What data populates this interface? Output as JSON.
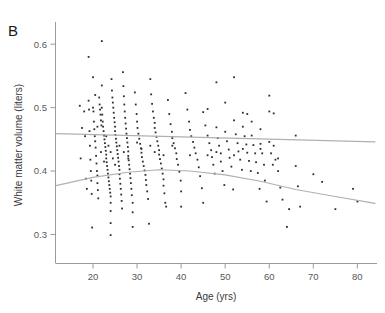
{
  "figure": {
    "panel_label": "B",
    "background_color": "#ffffff"
  },
  "axes": {
    "x_title": "Age (yrs)",
    "y_title": "White matter volume (liters)",
    "x_ticks": [
      "20",
      "30",
      "40",
      "50",
      "60",
      "70",
      "80"
    ],
    "y_ticks": [
      "0.3",
      "0.4",
      "0.5",
      "0.6"
    ]
  },
  "chart_data": {
    "type": "scatter",
    "title": "",
    "panel": "B",
    "xlabel": "Age (yrs)",
    "ylabel": "White matter volume (liters)",
    "xlim": [
      11.5,
      84.0
    ],
    "ylim": [
      0.255,
      0.635
    ],
    "xticks": [
      20,
      30,
      40,
      50,
      60,
      70,
      80
    ],
    "yticks": [
      0.3,
      0.4,
      0.5,
      0.6
    ],
    "grid": false,
    "legend": "none",
    "point_color": "#2e2e32",
    "trend_color": "#b0b0b2",
    "series": [
      {
        "name": "White matter volume",
        "marker": "square",
        "points": [
          [
            17.0,
            0.503
          ],
          [
            17.2,
            0.42
          ],
          [
            17.5,
            0.468
          ],
          [
            18.0,
            0.494
          ],
          [
            18.2,
            0.455
          ],
          [
            18.4,
            0.388
          ],
          [
            18.6,
            0.372
          ],
          [
            19.0,
            0.58
          ],
          [
            19.0,
            0.511
          ],
          [
            19.1,
            0.497
          ],
          [
            19.2,
            0.463
          ],
          [
            19.3,
            0.44
          ],
          [
            19.4,
            0.418
          ],
          [
            19.5,
            0.4
          ],
          [
            19.6,
            0.385
          ],
          [
            19.7,
            0.364
          ],
          [
            19.8,
            0.311
          ],
          [
            20.0,
            0.548
          ],
          [
            20.0,
            0.5
          ],
          [
            20.1,
            0.494
          ],
          [
            20.2,
            0.478
          ],
          [
            20.3,
            0.466
          ],
          [
            20.4,
            0.455
          ],
          [
            20.5,
            0.447
          ],
          [
            20.6,
            0.437
          ],
          [
            20.7,
            0.424
          ],
          [
            20.8,
            0.412
          ],
          [
            20.9,
            0.4
          ],
          [
            21.0,
            0.393
          ],
          [
            21.0,
            0.381
          ],
          [
            21.1,
            0.37
          ],
          [
            21.2,
            0.357
          ],
          [
            21.4,
            0.516
          ],
          [
            21.5,
            0.505
          ],
          [
            21.6,
            0.497
          ],
          [
            21.7,
            0.489
          ],
          [
            21.8,
            0.48
          ],
          [
            21.9,
            0.472
          ],
          [
            22.0,
            0.605
          ],
          [
            22.0,
            0.535
          ],
          [
            22.0,
            0.5
          ],
          [
            22.1,
            0.489
          ],
          [
            22.2,
            0.478
          ],
          [
            22.3,
            0.47
          ],
          [
            22.4,
            0.463
          ],
          [
            22.5,
            0.456
          ],
          [
            22.6,
            0.45
          ],
          [
            22.7,
            0.444
          ],
          [
            22.8,
            0.438
          ],
          [
            22.9,
            0.432
          ],
          [
            23.0,
            0.426
          ],
          [
            23.0,
            0.42
          ],
          [
            23.1,
            0.414
          ],
          [
            23.2,
            0.408
          ],
          [
            23.3,
            0.402
          ],
          [
            23.4,
            0.396
          ],
          [
            23.5,
            0.39
          ],
          [
            23.6,
            0.384
          ],
          [
            23.7,
            0.378
          ],
          [
            23.8,
            0.372
          ],
          [
            23.9,
            0.366
          ],
          [
            24.0,
            0.36
          ],
          [
            24.0,
            0.35
          ],
          [
            24.0,
            0.337
          ],
          [
            24.0,
            0.318
          ],
          [
            24.0,
            0.299
          ],
          [
            24.2,
            0.545
          ],
          [
            24.3,
            0.527
          ],
          [
            24.4,
            0.516
          ],
          [
            24.5,
            0.508
          ],
          [
            24.6,
            0.5
          ],
          [
            24.7,
            0.492
          ],
          [
            24.8,
            0.484
          ],
          [
            24.9,
            0.477
          ],
          [
            25.0,
            0.47
          ],
          [
            25.0,
            0.463
          ],
          [
            25.1,
            0.457
          ],
          [
            25.2,
            0.451
          ],
          [
            25.3,
            0.445
          ],
          [
            25.4,
            0.439
          ],
          [
            25.5,
            0.433
          ],
          [
            25.6,
            0.427
          ],
          [
            25.7,
            0.421
          ],
          [
            25.8,
            0.415
          ],
          [
            25.9,
            0.408
          ],
          [
            26.0,
            0.402
          ],
          [
            26.0,
            0.395
          ],
          [
            26.1,
            0.388
          ],
          [
            26.2,
            0.38
          ],
          [
            26.3,
            0.372
          ],
          [
            26.4,
            0.363
          ],
          [
            26.5,
            0.353
          ],
          [
            26.6,
            0.341
          ],
          [
            26.8,
            0.556
          ],
          [
            26.9,
            0.534
          ],
          [
            27.0,
            0.518
          ],
          [
            27.1,
            0.505
          ],
          [
            27.2,
            0.494
          ],
          [
            27.3,
            0.484
          ],
          [
            27.4,
            0.475
          ],
          [
            27.5,
            0.467
          ],
          [
            27.6,
            0.459
          ],
          [
            27.7,
            0.452
          ],
          [
            27.8,
            0.445
          ],
          [
            27.9,
            0.438
          ],
          [
            28.0,
            0.431
          ],
          [
            28.0,
            0.424
          ],
          [
            28.1,
            0.417
          ],
          [
            28.2,
            0.41
          ],
          [
            28.3,
            0.403
          ],
          [
            28.4,
            0.396
          ],
          [
            28.5,
            0.389
          ],
          [
            28.6,
            0.381
          ],
          [
            28.7,
            0.372
          ],
          [
            28.8,
            0.362
          ],
          [
            29.0,
            0.35
          ],
          [
            29.0,
            0.335
          ],
          [
            29.0,
            0.312
          ],
          [
            29.5,
            0.524
          ],
          [
            29.7,
            0.505
          ],
          [
            29.9,
            0.49
          ],
          [
            30.0,
            0.478
          ],
          [
            30.1,
            0.468
          ],
          [
            30.3,
            0.459
          ],
          [
            30.5,
            0.451
          ],
          [
            30.7,
            0.443
          ],
          [
            30.9,
            0.436
          ],
          [
            31.0,
            0.429
          ],
          [
            31.1,
            0.422
          ],
          [
            31.3,
            0.415
          ],
          [
            31.5,
            0.408
          ],
          [
            31.7,
            0.401
          ],
          [
            31.9,
            0.394
          ],
          [
            32.0,
            0.386
          ],
          [
            32.1,
            0.378
          ],
          [
            32.3,
            0.368
          ],
          [
            32.5,
            0.356
          ],
          [
            32.7,
            0.317
          ],
          [
            33.0,
            0.545
          ],
          [
            33.2,
            0.521
          ],
          [
            33.4,
            0.506
          ],
          [
            33.6,
            0.494
          ],
          [
            33.8,
            0.484
          ],
          [
            34.0,
            0.476
          ],
          [
            34.0,
            0.468
          ],
          [
            34.2,
            0.461
          ],
          [
            34.4,
            0.454
          ],
          [
            34.6,
            0.447
          ],
          [
            34.8,
            0.44
          ],
          [
            35.0,
            0.433
          ],
          [
            35.0,
            0.426
          ],
          [
            35.2,
            0.419
          ],
          [
            35.4,
            0.412
          ],
          [
            35.6,
            0.404
          ],
          [
            35.8,
            0.396
          ],
          [
            36.0,
            0.387
          ],
          [
            36.0,
            0.377
          ],
          [
            36.2,
            0.365
          ],
          [
            36.4,
            0.35
          ],
          [
            36.6,
            0.344
          ],
          [
            37.0,
            0.512
          ],
          [
            37.3,
            0.49
          ],
          [
            37.6,
            0.474
          ],
          [
            37.9,
            0.462
          ],
          [
            38.0,
            0.452
          ],
          [
            38.3,
            0.444
          ],
          [
            38.6,
            0.436
          ],
          [
            38.9,
            0.428
          ],
          [
            39.0,
            0.419
          ],
          [
            39.3,
            0.41
          ],
          [
            39.6,
            0.399
          ],
          [
            39.9,
            0.385
          ],
          [
            40.0,
            0.368
          ],
          [
            40.0,
            0.344
          ],
          [
            41.0,
            0.523
          ],
          [
            41.4,
            0.497
          ],
          [
            41.8,
            0.478
          ],
          [
            42.0,
            0.465
          ],
          [
            42.3,
            0.455
          ],
          [
            42.7,
            0.446
          ],
          [
            43.0,
            0.437
          ],
          [
            43.3,
            0.428
          ],
          [
            43.7,
            0.418
          ],
          [
            44.0,
            0.406
          ],
          [
            44.3,
            0.392
          ],
          [
            44.7,
            0.373
          ],
          [
            45.0,
            0.35
          ],
          [
            45.0,
            0.493
          ],
          [
            45.5,
            0.472
          ],
          [
            46.0,
            0.498
          ],
          [
            46.0,
            0.456
          ],
          [
            46.4,
            0.444
          ],
          [
            46.8,
            0.433
          ],
          [
            47.0,
            0.422
          ],
          [
            47.3,
            0.41
          ],
          [
            47.6,
            0.396
          ],
          [
            48.0,
            0.54
          ],
          [
            48.0,
            0.469
          ],
          [
            48.3,
            0.452
          ],
          [
            48.6,
            0.44
          ],
          [
            49.0,
            0.428
          ],
          [
            49.0,
            0.415
          ],
          [
            49.4,
            0.4
          ],
          [
            49.8,
            0.378
          ],
          [
            50.0,
            0.508
          ],
          [
            50.0,
            0.462
          ],
          [
            50.4,
            0.447
          ],
          [
            50.8,
            0.434
          ],
          [
            51.0,
            0.421
          ],
          [
            51.4,
            0.407
          ],
          [
            51.8,
            0.371
          ],
          [
            52.0,
            0.548
          ],
          [
            52.0,
            0.48
          ],
          [
            52.4,
            0.458
          ],
          [
            52.8,
            0.444
          ],
          [
            53.0,
            0.431
          ],
          [
            53.4,
            0.418
          ],
          [
            53.8,
            0.402
          ],
          [
            54.0,
            0.492
          ],
          [
            54.0,
            0.47
          ],
          [
            54.4,
            0.455
          ],
          [
            54.8,
            0.442
          ],
          [
            55.0,
            0.49
          ],
          [
            55.0,
            0.429
          ],
          [
            55.4,
            0.416
          ],
          [
            55.8,
            0.4
          ],
          [
            56.0,
            0.478
          ],
          [
            56.0,
            0.456
          ],
          [
            56.4,
            0.441
          ],
          [
            56.8,
            0.428
          ],
          [
            57.0,
            0.414
          ],
          [
            57.4,
            0.397
          ],
          [
            57.8,
            0.372
          ],
          [
            58.0,
            0.466
          ],
          [
            58.0,
            0.443
          ],
          [
            58.4,
            0.428
          ],
          [
            58.8,
            0.41
          ],
          [
            59.0,
            0.385
          ],
          [
            59.4,
            0.352
          ],
          [
            60.0,
            0.519
          ],
          [
            60.0,
            0.494
          ],
          [
            60.0,
            0.446
          ],
          [
            60.4,
            0.428
          ],
          [
            60.8,
            0.41
          ],
          [
            61.0,
            0.491
          ],
          [
            61.0,
            0.44
          ],
          [
            61.4,
            0.418
          ],
          [
            62.0,
            0.4
          ],
          [
            62.5,
            0.374
          ],
          [
            63.0,
            0.355
          ],
          [
            64.0,
            0.312
          ],
          [
            64.5,
            0.34
          ],
          [
            66.0,
            0.456
          ],
          [
            66.0,
            0.408
          ],
          [
            66.5,
            0.376
          ],
          [
            67.0,
            0.344
          ],
          [
            70.0,
            0.395
          ],
          [
            72.0,
            0.383
          ],
          [
            75.0,
            0.34
          ],
          [
            79.0,
            0.372
          ],
          [
            80.0,
            0.352
          ],
          [
            20.5,
            0.52
          ],
          [
            21.0,
            0.47
          ],
          [
            21.8,
            0.43
          ],
          [
            22.5,
            0.415
          ],
          [
            23.0,
            0.455
          ],
          [
            23.5,
            0.44
          ],
          [
            24.0,
            0.43
          ],
          [
            24.5,
            0.42
          ],
          [
            25.0,
            0.41
          ],
          [
            26.0,
            0.44
          ],
          [
            27.0,
            0.43
          ],
          [
            28.0,
            0.42
          ],
          [
            30.0,
            0.445
          ],
          [
            31.0,
            0.435
          ],
          [
            33.0,
            0.44
          ],
          [
            34.0,
            0.43
          ],
          [
            36.0,
            0.425
          ],
          [
            38.0,
            0.44
          ],
          [
            42.0,
            0.425
          ],
          [
            46.0,
            0.425
          ],
          [
            48.0,
            0.43
          ],
          [
            52.0,
            0.425
          ],
          [
            54.0,
            0.435
          ],
          [
            58.0,
            0.435
          ],
          [
            62.0,
            0.42
          ]
        ]
      }
    ],
    "trend_lines": [
      {
        "name": "upper-trend-line",
        "kind": "linear",
        "points": [
          [
            11.6,
            0.459
          ],
          [
            84.0,
            0.446
          ]
        ]
      },
      {
        "name": "lower-trend-curve",
        "kind": "quadratic",
        "points": [
          [
            11.6,
            0.377
          ],
          [
            20,
            0.39
          ],
          [
            28,
            0.398
          ],
          [
            35,
            0.402
          ],
          [
            42,
            0.4
          ],
          [
            50,
            0.394
          ],
          [
            58,
            0.384
          ],
          [
            66,
            0.371
          ],
          [
            74,
            0.361
          ],
          [
            84,
            0.349
          ]
        ]
      }
    ]
  }
}
